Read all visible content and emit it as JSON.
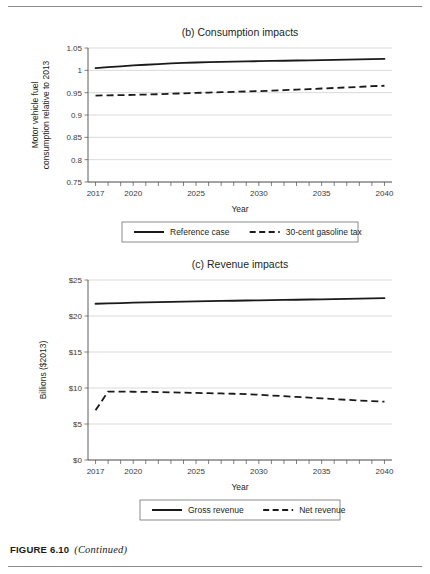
{
  "page": {
    "caption_label": "FIGURE 6.10",
    "caption_continued": "(Continued)"
  },
  "chart_data": [
    {
      "id": "b",
      "type": "line",
      "title": "(b) Consumption impacts",
      "xlabel": "Year",
      "ylabel_line1": "Motor vehicle fuel",
      "ylabel_line2": "consumption relative to 2013",
      "ylabel": "Motor vehicle fuel consumption relative to 2013",
      "xlim": [
        2016.4,
        2040.6
      ],
      "ylim": [
        0.75,
        1.05
      ],
      "grid": true,
      "legend_position": "bottom",
      "y_ticks": [
        0.75,
        0.8,
        0.85,
        0.9,
        0.95,
        1,
        1.05
      ],
      "y_tick_labels": [
        "0.75",
        "0.8",
        "0.85",
        "0.9",
        "0.95",
        "1",
        "1.05"
      ],
      "x_ticks": [
        2017,
        2020,
        2025,
        2030,
        2035,
        2040
      ],
      "x_tick_labels": [
        "2017",
        "2020",
        "2025",
        "2030",
        "2035",
        "2040"
      ],
      "x_minor_ticks": [
        2017,
        2018,
        2019,
        2020,
        2021,
        2022,
        2023,
        2024,
        2025,
        2026,
        2027,
        2028,
        2029,
        2030,
        2031,
        2032,
        2033,
        2034,
        2035,
        2036,
        2037,
        2038,
        2039,
        2040
      ],
      "x": [
        2017,
        2018,
        2019,
        2020,
        2021,
        2022,
        2023,
        2024,
        2025,
        2026,
        2027,
        2028,
        2029,
        2030,
        2031,
        2032,
        2033,
        2034,
        2035,
        2036,
        2037,
        2038,
        2039,
        2040
      ],
      "series": [
        {
          "name": "Reference case",
          "style": "solid",
          "values": [
            1.005,
            1.007,
            1.009,
            1.011,
            1.0125,
            1.014,
            1.0155,
            1.0165,
            1.0175,
            1.0182,
            1.0188,
            1.0194,
            1.02,
            1.0205,
            1.021,
            1.0215,
            1.022,
            1.0225,
            1.023,
            1.0235,
            1.024,
            1.0245,
            1.025,
            1.0255
          ]
        },
        {
          "name": "30-cent gasoline tax",
          "style": "dashed",
          "values": [
            0.9435,
            0.944,
            0.9445,
            0.945,
            0.9458,
            0.9465,
            0.9475,
            0.9485,
            0.9495,
            0.9503,
            0.951,
            0.9518,
            0.9527,
            0.9535,
            0.9545,
            0.9555,
            0.9568,
            0.958,
            0.9593,
            0.9605,
            0.9618,
            0.963,
            0.9645,
            0.9655
          ]
        }
      ]
    },
    {
      "id": "c",
      "type": "line",
      "title": "(c) Revenue impacts",
      "xlabel": "Year",
      "ylabel": "Billions ($2013)",
      "xlim": [
        2016.4,
        2040.6
      ],
      "ylim": [
        0,
        25
      ],
      "grid": true,
      "legend_position": "bottom",
      "y_ticks": [
        0,
        5,
        10,
        15,
        20,
        25
      ],
      "y_tick_labels": [
        "$0",
        "$5",
        "$10",
        "$15",
        "$20",
        "$25"
      ],
      "x_ticks": [
        2017,
        2020,
        2025,
        2030,
        2035,
        2040
      ],
      "x_tick_labels": [
        "2017",
        "2020",
        "2025",
        "2030",
        "2035",
        "2040"
      ],
      "x_minor_ticks": [
        2017,
        2018,
        2019,
        2020,
        2021,
        2022,
        2023,
        2024,
        2025,
        2026,
        2027,
        2028,
        2029,
        2030,
        2031,
        2032,
        2033,
        2034,
        2035,
        2036,
        2037,
        2038,
        2039,
        2040
      ],
      "x": [
        2017,
        2018,
        2019,
        2020,
        2021,
        2022,
        2023,
        2024,
        2025,
        2026,
        2027,
        2028,
        2029,
        2030,
        2031,
        2032,
        2033,
        2034,
        2035,
        2036,
        2037,
        2038,
        2039,
        2040
      ],
      "series": [
        {
          "name": "Gross revenue",
          "style": "solid",
          "values": [
            21.7,
            21.75,
            21.8,
            21.85,
            21.88,
            21.92,
            21.96,
            22.0,
            22.03,
            22.06,
            22.09,
            22.12,
            22.15,
            22.18,
            22.2,
            22.23,
            22.26,
            22.29,
            22.32,
            22.35,
            22.38,
            22.41,
            22.44,
            22.47
          ]
        },
        {
          "name": "Net revenue",
          "style": "dashed",
          "values": [
            6.9,
            9.5,
            9.5,
            9.48,
            9.46,
            9.44,
            9.4,
            9.36,
            9.32,
            9.28,
            9.24,
            9.2,
            9.14,
            9.06,
            8.96,
            8.86,
            8.76,
            8.66,
            8.56,
            8.46,
            8.36,
            8.26,
            8.18,
            8.1
          ]
        }
      ]
    }
  ]
}
